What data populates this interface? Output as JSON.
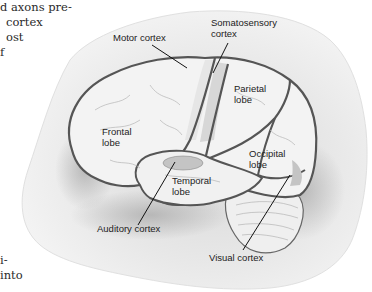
{
  "body_text": {
    "top_lines": [
      "d axons pre-",
      "cortex",
      "ost",
      "f"
    ],
    "bottom_lines": [
      "i-",
      "into"
    ]
  },
  "figure": {
    "labels": {
      "motor_cortex": "Motor cortex",
      "somatosensory_cortex_1": "Somatosensory",
      "somatosensory_cortex_2": "cortex",
      "parietal_lobe_1": "Parietal",
      "parietal_lobe_2": "lobe",
      "frontal_lobe_1": "Frontal",
      "frontal_lobe_2": "lobe",
      "occipital_lobe_1": "Occipital",
      "occipital_lobe_2": "lobe",
      "temporal_lobe_1": "Temporal",
      "temporal_lobe_2": "lobe",
      "auditory_cortex": "Auditory cortex",
      "visual_cortex": "Visual cortex"
    },
    "colors": {
      "background_wash": "#e6e6e6",
      "brain_fill": "#f3f3f3",
      "outline": "#555555",
      "highlight_region": "#bdbdbd"
    }
  }
}
